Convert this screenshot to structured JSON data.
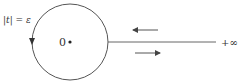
{
  "diagram": {
    "type": "contour",
    "circle_label": "|t| = ε",
    "origin_label": "0",
    "infinity_label": "+∞",
    "colors": {
      "stroke": "#555555",
      "text": "#333333",
      "background": "#ffffff"
    },
    "circle": {
      "cx": 70,
      "cy": 42,
      "r": 38,
      "orientation": "counterclockwise-arrow-on-left-pointing-down"
    },
    "ray": {
      "from_x": 108,
      "to_x": 216,
      "y": 42
    },
    "arrows": [
      {
        "name": "incoming",
        "direction": "left",
        "x1": 158,
        "x2": 132,
        "y": 30
      },
      {
        "name": "outgoing",
        "direction": "right",
        "x1": 135,
        "x2": 161,
        "y": 53
      }
    ]
  }
}
